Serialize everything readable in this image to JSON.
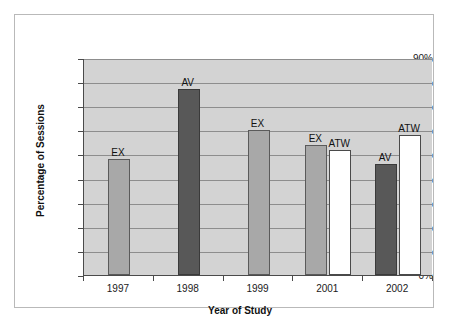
{
  "chart_data": {
    "type": "bar",
    "title": "",
    "xlabel": "Year of Study",
    "ylabel": "Percentage of Sessions",
    "categories": [
      "1997",
      "1998",
      "1999",
      "2001",
      "2002"
    ],
    "ylim": [
      0,
      90
    ],
    "ytick_labels": [
      "0%",
      "10%",
      "20%",
      "30%",
      "40%",
      "50%",
      "60%",
      "70%",
      "80%",
      "90%"
    ],
    "ytick_values": [
      0,
      10,
      20,
      30,
      40,
      50,
      60,
      70,
      80,
      90
    ],
    "grid": true,
    "legend": "none",
    "series": [
      {
        "name": "EX",
        "color": "#a8a8a8",
        "values": [
          48,
          null,
          60,
          54,
          null
        ]
      },
      {
        "name": "AV",
        "color": "#585858",
        "values": [
          null,
          77,
          null,
          null,
          46
        ]
      },
      {
        "name": "ATW",
        "color": "#ffffff",
        "values": [
          null,
          null,
          null,
          52,
          58
        ]
      }
    ],
    "bars": [
      {
        "category": "1997",
        "group_index": 0,
        "label": "EX",
        "value": 48,
        "style": "ex"
      },
      {
        "category": "1998",
        "group_index": 1,
        "label": "AV",
        "value": 77,
        "style": "av"
      },
      {
        "category": "1999",
        "group_index": 2,
        "label": "EX",
        "value": 60,
        "style": "ex"
      },
      {
        "category": "2001",
        "group_index": 3,
        "label": "EX",
        "value": 54,
        "style": "ex"
      },
      {
        "category": "2001",
        "group_index": 3,
        "label": "ATW",
        "value": 52,
        "style": "atw"
      },
      {
        "category": "2002",
        "group_index": 4,
        "label": "AV",
        "value": 46,
        "style": "av"
      },
      {
        "category": "2002",
        "group_index": 4,
        "label": "ATW",
        "value": 58,
        "style": "atw"
      }
    ],
    "annotations": [
      "EX",
      "AV",
      "EX",
      "EX",
      "ATW",
      "AV",
      "ATW"
    ],
    "colors": {
      "plot_background": "#d3d3d3",
      "gridline": "#8d8d8d",
      "axis": "#4a4a4a",
      "ex_bar": "#a8a8a8",
      "av_bar": "#585858",
      "atw_bar": "#ffffff",
      "figure_background": "#ffffff",
      "frame_border": "#b9b9b9"
    }
  }
}
